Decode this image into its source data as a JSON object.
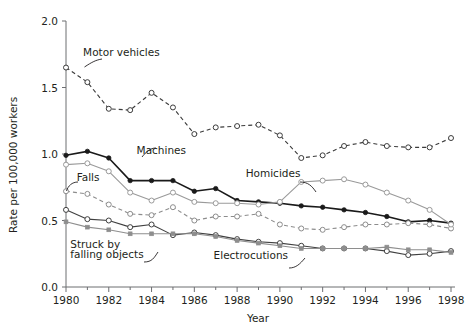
{
  "chart_data": {
    "type": "line",
    "title": "",
    "xlabel": "Year",
    "ylabel": "Rate per 100,000 workers",
    "xlim": [
      1980,
      1998
    ],
    "ylim": [
      0.0,
      2.0
    ],
    "grid": false,
    "legend_position": "inline-annotations",
    "xticks": [
      1980,
      1982,
      1984,
      1986,
      1988,
      1990,
      1992,
      1994,
      1996,
      1998
    ],
    "xtick_labels": [
      "1980",
      "1982",
      "1984",
      "1986",
      "1988",
      "1990",
      "1992",
      "1994",
      "1996",
      "1998"
    ],
    "yticks": [
      0.0,
      0.5,
      1.0,
      1.5,
      2.0
    ],
    "ytick_labels": [
      "0.0",
      "0.5",
      "1.0",
      "1.5",
      "2.0"
    ],
    "x": [
      1980,
      1981,
      1982,
      1983,
      1984,
      1985,
      1986,
      1987,
      1988,
      1989,
      1990,
      1991,
      1992,
      1993,
      1994,
      1995,
      1996,
      1997,
      1998
    ],
    "series": [
      {
        "name": "Motor vehicles",
        "style": "dashed-open-circle",
        "color": "#3b3b3b",
        "values": [
          1.65,
          1.54,
          1.34,
          1.33,
          1.46,
          1.35,
          1.15,
          1.2,
          1.21,
          1.22,
          1.14,
          0.97,
          0.99,
          1.06,
          1.09,
          1.06,
          1.05,
          1.05,
          1.12
        ]
      },
      {
        "name": "Machines",
        "style": "solid-filled-circle",
        "color": "#1a1a1a",
        "values": [
          0.99,
          1.02,
          0.97,
          0.8,
          0.8,
          0.8,
          0.72,
          0.74,
          0.65,
          0.64,
          0.63,
          0.61,
          0.6,
          0.58,
          0.56,
          0.53,
          0.49,
          0.5,
          0.48
        ]
      },
      {
        "name": "Falls",
        "style": "dashed-open-circle-gray",
        "color": "#8c8c8c",
        "values": [
          0.72,
          0.7,
          0.62,
          0.55,
          0.54,
          0.6,
          0.5,
          0.53,
          0.53,
          0.55,
          0.47,
          0.44,
          0.43,
          0.45,
          0.47,
          0.47,
          0.48,
          0.47,
          0.44
        ]
      },
      {
        "name": "Homicides",
        "style": "solid-open-circle-gray",
        "color": "#9a9a9a",
        "values": [
          0.92,
          0.93,
          0.87,
          0.71,
          0.65,
          0.71,
          0.64,
          0.63,
          0.63,
          0.62,
          0.64,
          0.79,
          0.8,
          0.81,
          0.77,
          0.71,
          0.65,
          0.58,
          0.47
        ]
      },
      {
        "name": "Struck by falling objects",
        "style": "solid-open-circle-dark",
        "color": "#404040",
        "values": [
          0.58,
          0.51,
          0.5,
          0.45,
          0.47,
          0.39,
          0.41,
          0.39,
          0.36,
          0.34,
          0.33,
          0.31,
          0.29,
          0.29,
          0.29,
          0.27,
          0.24,
          0.25,
          0.27
        ]
      },
      {
        "name": "Electrocutions",
        "style": "solid-small-square-gray",
        "color": "#8e8e8e",
        "values": [
          0.49,
          0.45,
          0.43,
          0.4,
          0.4,
          0.4,
          0.4,
          0.38,
          0.35,
          0.33,
          0.31,
          0.29,
          0.29,
          0.29,
          0.29,
          0.3,
          0.28,
          0.28,
          0.26
        ]
      }
    ],
    "annotations": [
      {
        "text": "Motor vehicles",
        "x": 1980.8,
        "y": 1.74
      },
      {
        "text": "Machines",
        "x": 1983.3,
        "y": 1.0
      },
      {
        "text": "Falls",
        "x": 1980.5,
        "y": 0.8
      },
      {
        "text": "Homicides",
        "x": 1988.4,
        "y": 0.83
      },
      {
        "text": "Struck by",
        "x": 1980.2,
        "y": 0.29
      },
      {
        "text": "falling objects",
        "x": 1980.2,
        "y": 0.22
      },
      {
        "text": "Electrocutions",
        "x": 1986.9,
        "y": 0.21
      }
    ]
  }
}
